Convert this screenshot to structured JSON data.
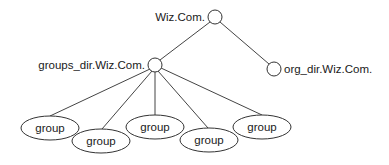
{
  "diagram": {
    "type": "tree",
    "root": {
      "label": "Wiz.Com.",
      "cx": 215,
      "cy": 17,
      "r": 7,
      "label_x": 205,
      "label_y": 21
    },
    "children": [
      {
        "label": "groups_dir.Wiz.Com.",
        "cx": 155,
        "cy": 65,
        "r": 7,
        "label_x": 145,
        "label_y": 69,
        "anchor": "end"
      },
      {
        "label": "org_dir.Wiz.Com.",
        "cx": 274,
        "cy": 69,
        "r": 7,
        "label_x": 284,
        "label_y": 73,
        "anchor": "start"
      }
    ],
    "groups": [
      {
        "label": "group",
        "cx": 50,
        "cy": 128,
        "rx": 29,
        "ry": 12
      },
      {
        "label": "group",
        "cx": 101,
        "cy": 141,
        "rx": 29,
        "ry": 12
      },
      {
        "label": "group",
        "cx": 155,
        "cy": 127,
        "rx": 29,
        "ry": 12
      },
      {
        "label": "group",
        "cx": 209,
        "cy": 140,
        "rx": 29,
        "ry": 12
      },
      {
        "label": "group",
        "cx": 262,
        "cy": 127,
        "rx": 29,
        "ry": 12
      }
    ]
  }
}
